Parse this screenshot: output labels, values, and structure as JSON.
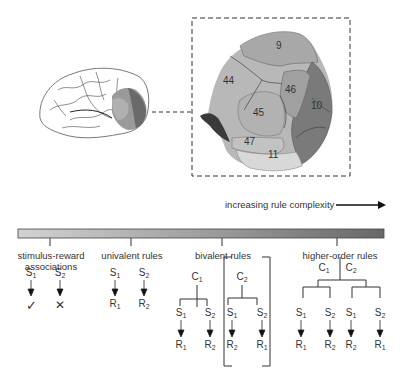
{
  "figure": {
    "type": "diagram"
  },
  "brain_inset": {
    "areas": [
      {
        "label": "9",
        "x": 282,
        "y": 45,
        "fill": "#a8a8a8"
      },
      {
        "label": "44",
        "x": 232,
        "y": 82,
        "fill": "#b8b8b8"
      },
      {
        "label": "46",
        "x": 292,
        "y": 91,
        "fill": "#a3a3a3"
      },
      {
        "label": "10",
        "x": 316,
        "y": 107,
        "fill": "#7c7c7c"
      },
      {
        "label": "45",
        "x": 259,
        "y": 114,
        "fill": "#b4b4b4"
      },
      {
        "label": "47",
        "x": 250,
        "y": 142,
        "fill": "#c4c4c4"
      },
      {
        "label": "11",
        "x": 272,
        "y": 155,
        "fill": "#d6d6d6"
      }
    ]
  },
  "complexity_axis": {
    "label": "increasing rule complexity",
    "gradient_start": "#cfcfcf",
    "gradient_end": "#6e6e6e"
  },
  "categories": [
    {
      "label_line1": "stimulus-reward",
      "label_line2": "associations"
    },
    {
      "label_line1": "univalent rules",
      "label_line2": ""
    },
    {
      "label_line1": "bivalent rules",
      "label_line2": ""
    },
    {
      "label_line1": "higher-order rules",
      "label_line2": ""
    }
  ],
  "symbols": {
    "S": "S",
    "R": "R",
    "C": "C",
    "one": "1",
    "two": "2",
    "check": "✓",
    "cross": "✕"
  }
}
